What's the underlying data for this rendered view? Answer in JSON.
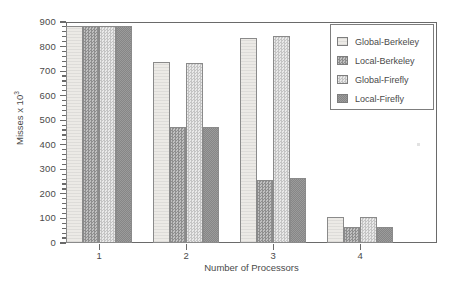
{
  "chart_data": {
    "type": "bar",
    "title": "",
    "xlabel": "Number of Processors",
    "ylabel": "Misses x 10",
    "ylabel_exponent": "3",
    "categories": [
      "1",
      "2",
      "3",
      "4"
    ],
    "ylim": [
      0,
      900
    ],
    "yticks": [
      0,
      100,
      200,
      300,
      400,
      500,
      600,
      700,
      800,
      900
    ],
    "ytick_labels": [
      "0",
      "100",
      "200",
      "300",
      "400",
      "500",
      "600",
      "700",
      "800",
      "900"
    ],
    "grid": false,
    "legend_position": "upper right",
    "series": [
      {
        "name": "Global-Berkeley",
        "values": [
          885,
          737,
          835,
          105
        ],
        "swatch": "fill-0",
        "color": "#eceae6"
      },
      {
        "name": "Local-Berkeley",
        "values": [
          885,
          472,
          258,
          65
        ],
        "swatch": "fill-1",
        "color": "#9a9a9a"
      },
      {
        "name": "Global-Firefly",
        "values": [
          885,
          735,
          845,
          105
        ],
        "swatch": "fill-2",
        "color": "#cfcfcf"
      },
      {
        "name": "Local-Firefly",
        "values": [
          885,
          473,
          263,
          65
        ],
        "swatch": "fill-3",
        "color": "#8d8d8d"
      }
    ]
  },
  "legend": {
    "items": [
      {
        "label": "Global-Berkeley"
      },
      {
        "label": "Local-Berkeley"
      },
      {
        "label": "Global-Firefly"
      },
      {
        "label": "Local-Firefly"
      }
    ]
  }
}
